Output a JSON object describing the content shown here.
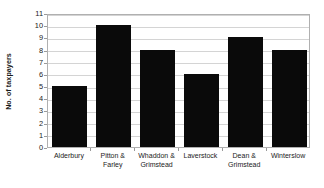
{
  "chart_data": {
    "type": "bar",
    "title": "",
    "subtitle": "",
    "xlabel": "",
    "ylabel": "No. of taxpayers",
    "categories": [
      "Alderbury",
      "Pitton & Farley",
      "Whaddon & Grimstead",
      "Laverstock",
      "Dean & Grimstead",
      "Winterslow"
    ],
    "values": [
      5,
      10,
      8,
      6,
      9,
      8
    ],
    "ylim": [
      0,
      11
    ],
    "ytick_labels": [
      "0",
      "1",
      "2",
      "3",
      "4",
      "5",
      "6",
      "7",
      "8",
      "9",
      "10",
      "11"
    ],
    "ytick_values": [
      0,
      1,
      2,
      3,
      4,
      5,
      6,
      7,
      8,
      9,
      10,
      11
    ],
    "grid": true,
    "grid_axis": "y",
    "legend": false,
    "legend_position": "none",
    "bar_color": "#0a0a0a",
    "gridline_color": "#d4d4d4",
    "axis_color": "#b0b0b0",
    "background_color": "#ffffff",
    "text_color": "#1b1b1b"
  }
}
